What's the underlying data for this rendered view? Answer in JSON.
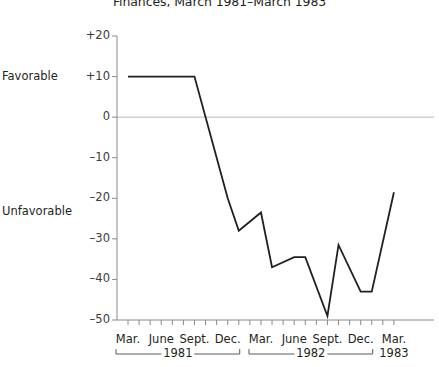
{
  "chart_data": {
    "type": "line",
    "title": "Finances, March 1981–March 1983",
    "xlabel": "",
    "ylabel": "",
    "ylim": [
      -50,
      20
    ],
    "yticks": [
      20,
      10,
      0,
      -10,
      -20,
      -30,
      -40,
      -50
    ],
    "ytick_labels": [
      "+20",
      "+10",
      "0",
      "–10",
      "–20",
      "–30",
      "–40",
      "–50"
    ],
    "grid": false,
    "zero_line": true,
    "legend": "none",
    "axis_side_labels": [
      {
        "text": "Favorable",
        "value": 10
      },
      {
        "text": "Unfavorable",
        "value": -23.5
      }
    ],
    "x_tick_interval": "monthly",
    "x_labeled_months": [
      {
        "label": "Mar.",
        "index": 0
      },
      {
        "label": "June",
        "index": 3
      },
      {
        "label": "Sept.",
        "index": 6
      },
      {
        "label": "Dec.",
        "index": 9
      },
      {
        "label": "Mar.",
        "index": 12
      },
      {
        "label": "June",
        "index": 15
      },
      {
        "label": "Sept.",
        "index": 18
      },
      {
        "label": "Dec.",
        "index": 21
      },
      {
        "label": "Mar.",
        "index": 24
      }
    ],
    "year_brackets": [
      {
        "label": "1981",
        "start_index": 0,
        "end_index": 9
      },
      {
        "label": "1982",
        "start_index": 12,
        "end_index": 21
      },
      {
        "label": "1983",
        "start_index": 24,
        "end_index": 24
      }
    ],
    "x": [
      0,
      6,
      9,
      10,
      12,
      13,
      15,
      16,
      18,
      19,
      21,
      22,
      24
    ],
    "values": [
      10,
      10,
      -20,
      -28,
      -23.5,
      -37,
      -34.5,
      -34.5,
      -49,
      -31.5,
      -43,
      -43,
      -18.5
    ],
    "series": [
      {
        "name": "Net finances rating",
        "color": "#231f20",
        "points": [
          {
            "month_index": 0,
            "value": 10
          },
          {
            "month_index": 6,
            "value": 10
          },
          {
            "month_index": 9,
            "value": -20
          },
          {
            "month_index": 10,
            "value": -28
          },
          {
            "month_index": 12,
            "value": -23.5
          },
          {
            "month_index": 13,
            "value": -37
          },
          {
            "month_index": 15,
            "value": -34.5
          },
          {
            "month_index": 16,
            "value": -34.5
          },
          {
            "month_index": 18,
            "value": -49
          },
          {
            "month_index": 19,
            "value": -31.5
          },
          {
            "month_index": 21,
            "value": -43
          },
          {
            "month_index": 22,
            "value": -43
          },
          {
            "month_index": 24,
            "value": -18.5
          }
        ]
      }
    ]
  }
}
